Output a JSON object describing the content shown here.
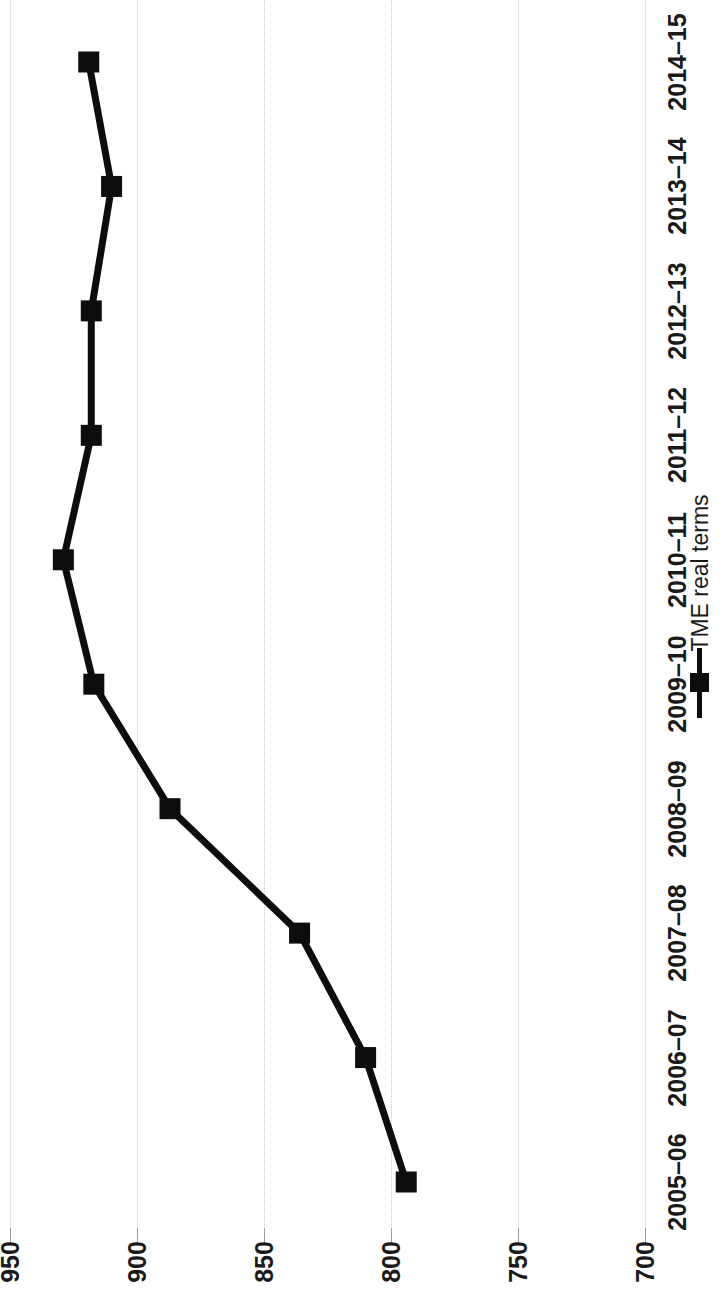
{
  "chart_data": {
    "type": "line",
    "title": "",
    "subtitle": "",
    "xlabel": "",
    "ylabel": "",
    "orientation": "rotated-90-ccw",
    "grid": true,
    "legend_position": "right",
    "categories": [
      "2005–06",
      "2006–07",
      "2007–08",
      "2008–09",
      "2009–10",
      "2010–11",
      "2011–12",
      "2012–13",
      "2013–14",
      "2014–15"
    ],
    "series": [
      {
        "name": "TME real terms",
        "color": "#0d0d0d",
        "marker": "square",
        "values": [
          794,
          810,
          836,
          887,
          917,
          929,
          918,
          918,
          910,
          919
        ]
      }
    ],
    "value_axis": {
      "ticks": [
        950,
        900,
        850,
        800,
        750,
        700
      ],
      "tick_labels": [
        "950",
        "900",
        "850",
        "800",
        "750",
        "700"
      ],
      "min": 700,
      "max": 950,
      "reversed": true
    }
  },
  "legend": {
    "entries": [
      {
        "label": "TME real terms",
        "color": "#0d0d0d"
      }
    ]
  },
  "colors": {
    "series": "#0d0d0d",
    "gridline": "#c8c8c8",
    "text": "#1a1a1a",
    "background": "#ffffff"
  }
}
